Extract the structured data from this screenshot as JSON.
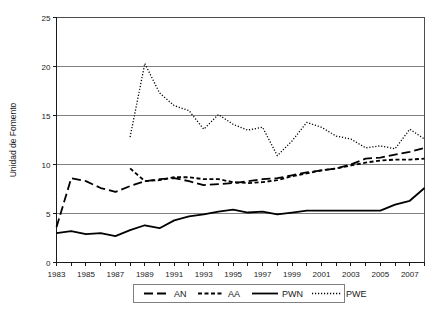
{
  "chart_data": {
    "type": "line",
    "title": "",
    "xlabel": "",
    "ylabel": "Unidad de Fomento",
    "xlim": [
      1983,
      2008
    ],
    "ylim": [
      0,
      25
    ],
    "yticks": [
      0,
      5,
      10,
      15,
      20,
      25
    ],
    "ytick_labels": [
      "0",
      "5",
      "10",
      "15",
      "20",
      "25"
    ],
    "xticks": [
      1983,
      1984,
      1985,
      1986,
      1987,
      1988,
      1989,
      1990,
      1991,
      1992,
      1993,
      1994,
      1995,
      1996,
      1997,
      1998,
      1999,
      2000,
      2001,
      2002,
      2003,
      2004,
      2005,
      2006,
      2007,
      2008
    ],
    "xtick_labels": [
      "1983",
      "",
      "1985",
      "",
      "1987",
      "",
      "1989",
      "",
      "1991",
      "",
      "1993",
      "",
      "1995",
      "",
      "1997",
      "",
      "1999",
      "",
      "2001",
      "",
      "2003",
      "",
      "2005",
      "",
      "2007",
      ""
    ],
    "grid": "horizontal",
    "legend_position": "bottom",
    "series": [
      {
        "name": "AN",
        "style": "long-dash",
        "x": [
          1983,
          1984,
          1985,
          1986,
          1987,
          1988,
          1989,
          1990,
          1991,
          1992,
          1993,
          1994,
          1995,
          1996,
          1997,
          1998,
          1999,
          2000,
          2001,
          2002,
          2003,
          2004,
          2005,
          2006,
          2007,
          2008
        ],
        "values": [
          3.6,
          8.6,
          8.3,
          7.6,
          7.2,
          7.8,
          8.3,
          8.5,
          8.6,
          8.3,
          7.9,
          8.0,
          8.1,
          8.3,
          8.5,
          8.6,
          8.9,
          9.2,
          9.4,
          9.6,
          10.0,
          10.6,
          10.7,
          11.0,
          11.3,
          11.7
        ]
      },
      {
        "name": "AA",
        "style": "short-dash",
        "x": [
          1988,
          1989,
          1990,
          1991,
          1992,
          1993,
          1994,
          1995,
          1996,
          1997,
          1998,
          1999,
          2000,
          2001,
          2002,
          2003,
          2004,
          2005,
          2006,
          2007,
          2008
        ],
        "values": [
          9.6,
          8.3,
          8.4,
          8.7,
          8.7,
          8.5,
          8.5,
          8.2,
          8.1,
          8.2,
          8.4,
          8.8,
          9.1,
          9.4,
          9.6,
          9.9,
          10.2,
          10.4,
          10.5,
          10.5,
          10.6
        ]
      },
      {
        "name": "PWN",
        "style": "solid",
        "x": [
          1983,
          1984,
          1985,
          1986,
          1987,
          1988,
          1989,
          1990,
          1991,
          1992,
          1993,
          1994,
          1995,
          1996,
          1997,
          1998,
          1999,
          2000,
          2001,
          2002,
          2003,
          2004,
          2005,
          2006,
          2007,
          2008
        ],
        "values": [
          3.0,
          3.2,
          2.9,
          3.0,
          2.7,
          3.3,
          3.8,
          3.5,
          4.3,
          4.7,
          4.9,
          5.2,
          5.4,
          5.1,
          5.2,
          4.9,
          5.1,
          5.3,
          5.3,
          5.3,
          5.3,
          5.3,
          5.3,
          5.9,
          6.3,
          7.6
        ]
      },
      {
        "name": "PWE",
        "style": "dotted",
        "x": [
          1988,
          1989,
          1990,
          1991,
          1992,
          1993,
          1994,
          1995,
          1996,
          1997,
          1998,
          1999,
          2000,
          2001,
          2002,
          2003,
          2004,
          2005,
          2006,
          2007,
          2008
        ],
        "values": [
          12.8,
          20.3,
          17.3,
          16.0,
          15.5,
          13.6,
          15.1,
          14.1,
          13.5,
          13.8,
          10.9,
          12.4,
          14.3,
          13.8,
          12.9,
          12.6,
          11.7,
          11.9,
          11.6,
          13.6,
          12.6
        ]
      }
    ]
  },
  "legend": {
    "items": [
      {
        "label": "AN",
        "style": "long-dash"
      },
      {
        "label": "AA",
        "style": "short-dash"
      },
      {
        "label": "PWN",
        "style": "solid"
      },
      {
        "label": "PWE",
        "style": "dotted"
      }
    ]
  }
}
